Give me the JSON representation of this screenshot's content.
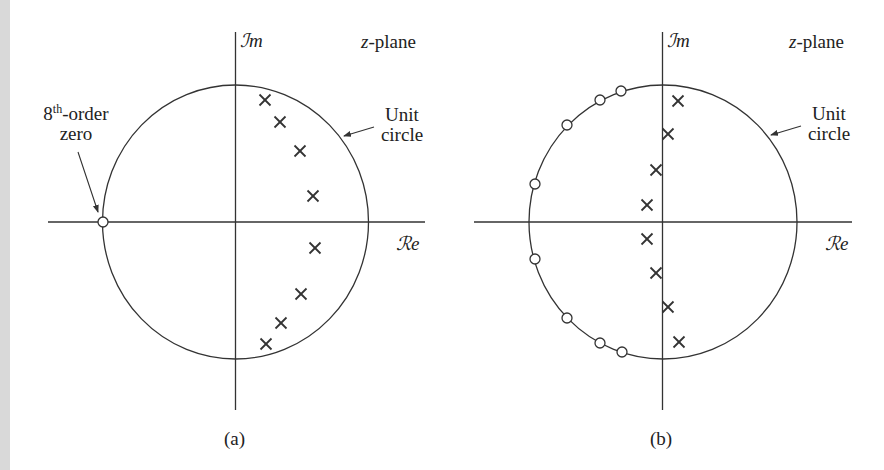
{
  "figure": {
    "panels": [
      {
        "id": "a",
        "caption": "(a)",
        "plane_label_var": "z",
        "plane_label_rest": "-plane",
        "im_axis_label": "ℐm",
        "re_axis_label": "ℛe",
        "unit_circle_label_line1": "Unit",
        "unit_circle_label_line2": "circle",
        "zero_label_prefix": "8",
        "zero_label_sup": "th",
        "zero_label_rest": "-order",
        "zero_label_line2": "zero",
        "center": [
          235,
          222
        ],
        "radius": [
          133,
          137
        ],
        "poles": [
          [
            265,
            100
          ],
          [
            280,
            122
          ],
          [
            300,
            151
          ],
          [
            313,
            196
          ],
          [
            315,
            248
          ],
          [
            301,
            294
          ],
          [
            281,
            323
          ],
          [
            266,
            344
          ]
        ],
        "zeros": [
          [
            103,
            222
          ]
        ]
      },
      {
        "id": "b",
        "caption": "(b)",
        "plane_label_var": "z",
        "plane_label_rest": "-plane",
        "im_axis_label": "ℐm",
        "re_axis_label": "ℛe",
        "unit_circle_label_line1": "Unit",
        "unit_circle_label_line2": "circle",
        "center": [
          663,
          222
        ],
        "radius": [
          134,
          137
        ],
        "poles": [
          [
            678,
            101
          ],
          [
            668,
            134
          ],
          [
            656,
            170
          ],
          [
            647,
            205
          ],
          [
            647,
            239
          ],
          [
            656,
            273
          ],
          [
            668,
            307
          ],
          [
            679,
            342
          ]
        ],
        "zeros": [
          [
            621,
            91
          ],
          [
            600,
            100
          ],
          [
            567,
            125
          ],
          [
            535,
            184
          ],
          [
            535,
            259
          ],
          [
            567,
            318
          ],
          [
            600,
            343
          ],
          [
            622,
            352
          ]
        ]
      }
    ],
    "colors": {
      "stroke": "#333333",
      "background": "#ffffff",
      "strip": "#d9d9d9"
    }
  }
}
